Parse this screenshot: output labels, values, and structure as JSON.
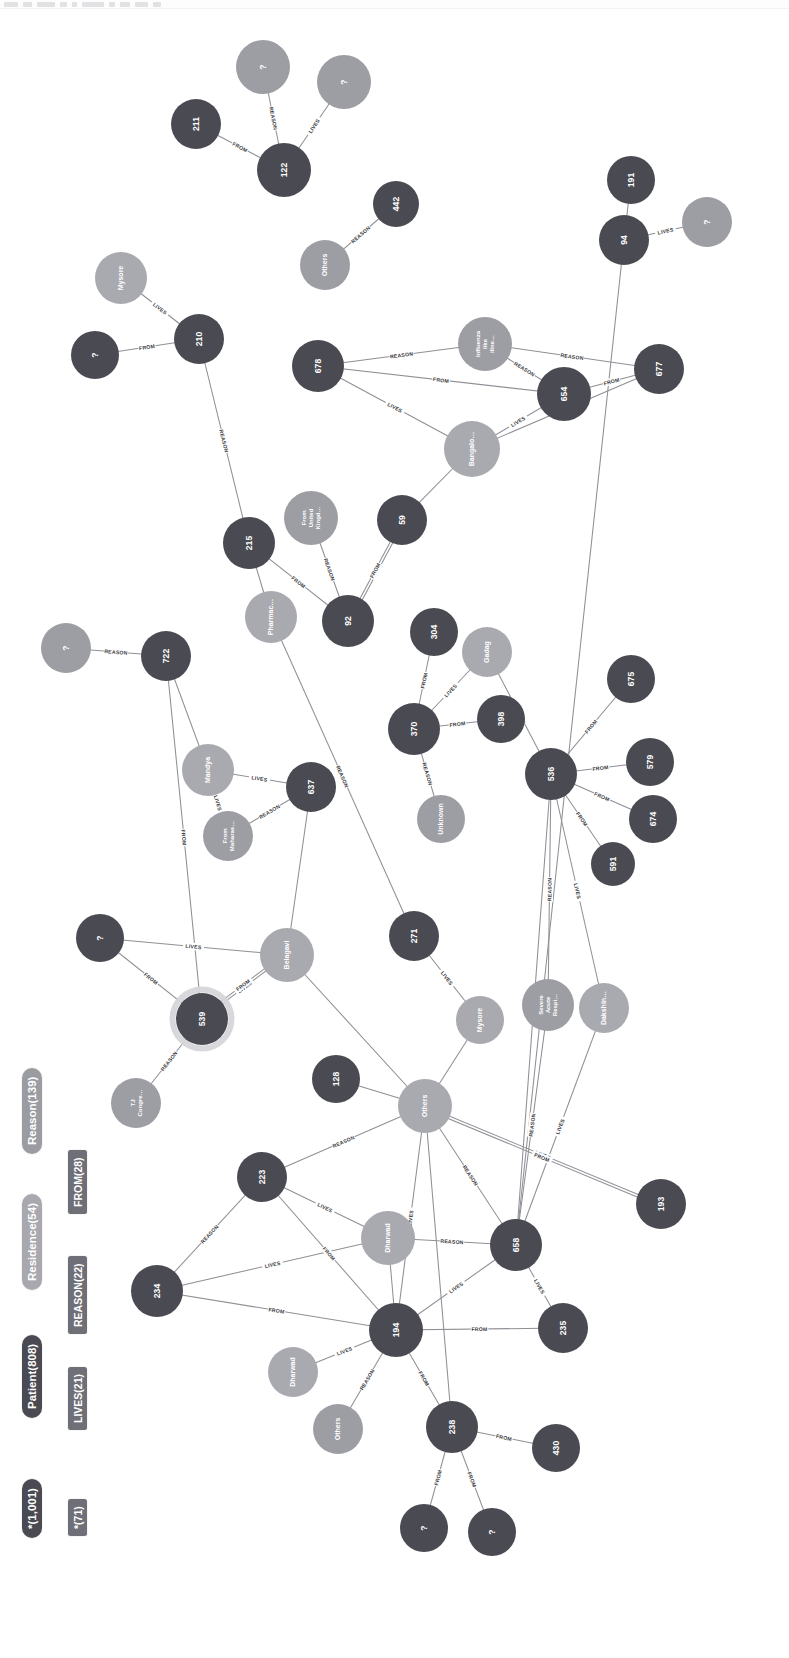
{
  "toolbar": {
    "chips": [
      14,
      9,
      18,
      7,
      5,
      22,
      6,
      10,
      13,
      8
    ]
  },
  "legend": {
    "node_categories": [
      {
        "label": "*(1,001)",
        "color": "#4a4a52",
        "text": "#ffffff"
      },
      {
        "label": "Patient(808)",
        "color": "#4a4a52",
        "text": "#ffffff"
      },
      {
        "label": "Residence(54)",
        "color": "#a8a8ae",
        "text": "#ffffff"
      },
      {
        "label": "Reason(139)",
        "color": "#9b9ba2",
        "text": "#ffffff"
      }
    ],
    "relationship_categories": [
      {
        "label": "*(71)",
        "color": "#6f6f77",
        "text": "#ffffff"
      },
      {
        "label": "LIVES(21)",
        "color": "#6f6f77",
        "text": "#ffffff"
      },
      {
        "label": "REASON(22)",
        "color": "#6f6f77",
        "text": "#ffffff"
      },
      {
        "label": "FROM(28)",
        "color": "#6f6f77",
        "text": "#ffffff"
      }
    ]
  },
  "colors": {
    "patient": "#4a4a52",
    "residence": "#a9a9b0",
    "reason": "#9d9da4",
    "edge": "#8f8f96",
    "background": "#ffffff",
    "selection_halo": "#d6d6da"
  },
  "chart_data": {
    "type": "graph",
    "node_count": 1001,
    "relationship_count": 71,
    "nodes": [
      {
        "id": "n_q1",
        "label": "?",
        "type": "reason",
        "x": 263,
        "y": 67,
        "r": 27
      },
      {
        "id": "n_q2",
        "label": "?",
        "type": "reason",
        "x": 344,
        "y": 82,
        "r": 27
      },
      {
        "id": "n_211",
        "label": "211",
        "type": "patient",
        "x": 196,
        "y": 124,
        "r": 25
      },
      {
        "id": "n_122",
        "label": "122",
        "type": "patient",
        "x": 284,
        "y": 170,
        "r": 27
      },
      {
        "id": "n_442",
        "label": "442",
        "type": "patient",
        "x": 396,
        "y": 204,
        "r": 23
      },
      {
        "id": "n_others1",
        "label": "Others",
        "type": "reason",
        "x": 325,
        "y": 265,
        "r": 25
      },
      {
        "id": "n_191",
        "label": "191",
        "type": "patient",
        "x": 631,
        "y": 180,
        "r": 24
      },
      {
        "id": "n_94",
        "label": "94",
        "type": "patient",
        "x": 624,
        "y": 240,
        "r": 25
      },
      {
        "id": "n_q3",
        "label": "?",
        "type": "reason",
        "x": 707,
        "y": 222,
        "r": 25
      },
      {
        "id": "n_mysore1",
        "label": "Mysore",
        "type": "residence",
        "x": 121,
        "y": 278,
        "r": 26
      },
      {
        "id": "n_q4",
        "label": "?",
        "type": "patient",
        "x": 95,
        "y": 355,
        "r": 24
      },
      {
        "id": "n_210",
        "label": "210",
        "type": "patient",
        "x": 199,
        "y": 339,
        "r": 25
      },
      {
        "id": "n_678",
        "label": "678",
        "type": "patient",
        "x": 318,
        "y": 366,
        "r": 26
      },
      {
        "id": "n_influ",
        "label": "Influenza like illne…",
        "type": "reason",
        "x": 485,
        "y": 344,
        "r": 27
      },
      {
        "id": "n_654",
        "label": "654",
        "type": "patient",
        "x": 564,
        "y": 394,
        "r": 27
      },
      {
        "id": "n_677",
        "label": "677",
        "type": "patient",
        "x": 659,
        "y": 369,
        "r": 25
      },
      {
        "id": "n_bang",
        "label": "Bangalo…",
        "type": "residence",
        "x": 472,
        "y": 449,
        "r": 28
      },
      {
        "id": "n_uk",
        "label": "From United Kingd…",
        "type": "reason",
        "x": 311,
        "y": 518,
        "r": 27
      },
      {
        "id": "n_59",
        "label": "59",
        "type": "patient",
        "x": 402,
        "y": 520,
        "r": 25
      },
      {
        "id": "n_215",
        "label": "215",
        "type": "patient",
        "x": 249,
        "y": 543,
        "r": 26
      },
      {
        "id": "n_pharma",
        "label": "Pharmac…",
        "type": "residence",
        "x": 271,
        "y": 617,
        "r": 26
      },
      {
        "id": "n_92",
        "label": "92",
        "type": "patient",
        "x": 348,
        "y": 621,
        "r": 26
      },
      {
        "id": "n_304",
        "label": "304",
        "type": "patient",
        "x": 434,
        "y": 632,
        "r": 24
      },
      {
        "id": "n_gadag",
        "label": "Gadag",
        "type": "residence",
        "x": 487,
        "y": 652,
        "r": 25
      },
      {
        "id": "n_q5",
        "label": "?",
        "type": "reason",
        "x": 66,
        "y": 648,
        "r": 25
      },
      {
        "id": "n_722",
        "label": "722",
        "type": "patient",
        "x": 166,
        "y": 656,
        "r": 25
      },
      {
        "id": "n_370",
        "label": "370",
        "type": "patient",
        "x": 414,
        "y": 729,
        "r": 26
      },
      {
        "id": "n_398",
        "label": "398",
        "type": "patient",
        "x": 501,
        "y": 719,
        "r": 24
      },
      {
        "id": "n_675",
        "label": "675",
        "type": "patient",
        "x": 631,
        "y": 679,
        "r": 24
      },
      {
        "id": "n_536",
        "label": "536",
        "type": "patient",
        "x": 551,
        "y": 774,
        "r": 26
      },
      {
        "id": "n_579",
        "label": "579",
        "type": "patient",
        "x": 650,
        "y": 762,
        "r": 24
      },
      {
        "id": "n_674",
        "label": "674",
        "type": "patient",
        "x": 653,
        "y": 819,
        "r": 24
      },
      {
        "id": "n_591",
        "label": "591",
        "type": "patient",
        "x": 613,
        "y": 864,
        "r": 22
      },
      {
        "id": "n_mandya",
        "label": "Mandya",
        "type": "residence",
        "x": 208,
        "y": 770,
        "r": 26
      },
      {
        "id": "n_637",
        "label": "637",
        "type": "patient",
        "x": 311,
        "y": 787,
        "r": 25
      },
      {
        "id": "n_mahar",
        "label": "From Maharas…",
        "type": "reason",
        "x": 228,
        "y": 836,
        "r": 25
      },
      {
        "id": "n_unk",
        "label": "Unknown",
        "type": "reason",
        "x": 441,
        "y": 819,
        "r": 24
      },
      {
        "id": "n_q6",
        "label": "?",
        "type": "patient",
        "x": 100,
        "y": 938,
        "r": 24
      },
      {
        "id": "n_belagavi",
        "label": "Belagavi",
        "type": "residence",
        "x": 287,
        "y": 955,
        "r": 27
      },
      {
        "id": "n_271",
        "label": "271",
        "type": "patient",
        "x": 414,
        "y": 936,
        "r": 25
      },
      {
        "id": "n_539",
        "label": "539",
        "type": "patient",
        "x": 202,
        "y": 1019,
        "r": 26,
        "selected": true
      },
      {
        "id": "n_mysore2",
        "label": "Mysore",
        "type": "residence",
        "x": 480,
        "y": 1020,
        "r": 24
      },
      {
        "id": "n_sars",
        "label": "Severe Acute Respi…",
        "type": "reason",
        "x": 548,
        "y": 1005,
        "r": 26
      },
      {
        "id": "n_dakshin",
        "label": "Dakshin…",
        "type": "residence",
        "x": 604,
        "y": 1008,
        "r": 25
      },
      {
        "id": "n_tjcong",
        "label": "TJ Congre…",
        "type": "reason",
        "x": 136,
        "y": 1103,
        "r": 25
      },
      {
        "id": "n_128",
        "label": "128",
        "type": "patient",
        "x": 336,
        "y": 1079,
        "r": 24
      },
      {
        "id": "n_others2",
        "label": "Others",
        "type": "residence",
        "x": 425,
        "y": 1106,
        "r": 27
      },
      {
        "id": "n_223",
        "label": "223",
        "type": "patient",
        "x": 262,
        "y": 1177,
        "r": 25
      },
      {
        "id": "n_dharwad1",
        "label": "Dharwad",
        "type": "residence",
        "x": 388,
        "y": 1238,
        "r": 27
      },
      {
        "id": "n_658",
        "label": "658",
        "type": "patient",
        "x": 516,
        "y": 1245,
        "r": 26
      },
      {
        "id": "n_193",
        "label": "193",
        "type": "patient",
        "x": 661,
        "y": 1204,
        "r": 25
      },
      {
        "id": "n_234",
        "label": "234",
        "type": "patient",
        "x": 157,
        "y": 1291,
        "r": 26
      },
      {
        "id": "n_194",
        "label": "194",
        "type": "patient",
        "x": 396,
        "y": 1330,
        "r": 27
      },
      {
        "id": "n_235",
        "label": "235",
        "type": "patient",
        "x": 563,
        "y": 1328,
        "r": 25
      },
      {
        "id": "n_dharwad2",
        "label": "Dharwad",
        "type": "residence",
        "x": 293,
        "y": 1372,
        "r": 25
      },
      {
        "id": "n_others3",
        "label": "Others",
        "type": "reason",
        "x": 338,
        "y": 1429,
        "r": 25
      },
      {
        "id": "n_238",
        "label": "238",
        "type": "patient",
        "x": 452,
        "y": 1427,
        "r": 26
      },
      {
        "id": "n_430",
        "label": "430",
        "type": "patient",
        "x": 556,
        "y": 1448,
        "r": 24
      },
      {
        "id": "n_q7",
        "label": "?",
        "type": "patient",
        "x": 424,
        "y": 1528,
        "r": 24
      },
      {
        "id": "n_q8",
        "label": "?",
        "type": "patient",
        "x": 492,
        "y": 1532,
        "r": 24
      }
    ],
    "edges": [
      {
        "source": "n_211",
        "target": "n_122",
        "label": "FROM"
      },
      {
        "source": "n_q1",
        "target": "n_122",
        "label": "REASON"
      },
      {
        "source": "n_q2",
        "target": "n_122",
        "label": "LIVES"
      },
      {
        "source": "n_others1",
        "target": "n_442",
        "label": "REASON"
      },
      {
        "source": "n_191",
        "target": "n_94",
        "label": ""
      },
      {
        "source": "n_94",
        "target": "n_q3",
        "label": "LIVES"
      },
      {
        "source": "n_94",
        "target": "n_658",
        "label": ""
      },
      {
        "source": "n_mysore1",
        "target": "n_210",
        "label": "LIVES"
      },
      {
        "source": "n_q4",
        "target": "n_210",
        "label": "FROM"
      },
      {
        "source": "n_210",
        "target": "n_215",
        "label": "REASON"
      },
      {
        "source": "n_678",
        "target": "n_influ",
        "label": "REASON"
      },
      {
        "source": "n_678",
        "target": "n_654",
        "label": "FROM"
      },
      {
        "source": "n_678",
        "target": "n_bang",
        "label": "LIVES"
      },
      {
        "source": "n_654",
        "target": "n_influ",
        "label": "REASON"
      },
      {
        "source": "n_677",
        "target": "n_influ",
        "label": "REASON"
      },
      {
        "source": "n_654",
        "target": "n_677",
        "label": "FROM"
      },
      {
        "source": "n_654",
        "target": "n_bang",
        "label": "LIVES"
      },
      {
        "source": "n_677",
        "target": "n_bang",
        "label": ""
      },
      {
        "source": "n_bang",
        "target": "n_59",
        "label": ""
      },
      {
        "source": "n_215",
        "target": "n_92",
        "label": "FROM"
      },
      {
        "source": "n_uk",
        "target": "n_92",
        "label": "REASON"
      },
      {
        "source": "n_92",
        "target": "n_59",
        "label": "FROM"
      },
      {
        "source": "n_92",
        "target": "n_59",
        "label": ""
      },
      {
        "source": "n_215",
        "target": "n_pharma",
        "label": ""
      },
      {
        "source": "n_pharma",
        "target": "n_271",
        "label": "REASON"
      },
      {
        "source": "n_q5",
        "target": "n_722",
        "label": "REASON"
      },
      {
        "source": "n_722",
        "target": "n_mandya",
        "label": ""
      },
      {
        "source": "n_722",
        "target": "n_539",
        "label": "FROM"
      },
      {
        "source": "n_mandya",
        "target": "n_637",
        "label": "LIVES"
      },
      {
        "source": "n_mandya",
        "target": "n_mahar",
        "label": "LIVES"
      },
      {
        "source": "n_637",
        "target": "n_mahar",
        "label": "REASON"
      },
      {
        "source": "n_637",
        "target": "n_belagavi",
        "label": ""
      },
      {
        "source": "n_304",
        "target": "n_370",
        "label": "FROM"
      },
      {
        "source": "n_gadag",
        "target": "n_370",
        "label": "LIVES"
      },
      {
        "source": "n_398",
        "target": "n_370",
        "label": "FROM"
      },
      {
        "source": "n_370",
        "target": "n_unk",
        "label": "REASON"
      },
      {
        "source": "n_536",
        "target": "n_675",
        "label": "FROM"
      },
      {
        "source": "n_536",
        "target": "n_579",
        "label": "FROM"
      },
      {
        "source": "n_536",
        "target": "n_674",
        "label": "FROM"
      },
      {
        "source": "n_536",
        "target": "n_591",
        "label": "FROM"
      },
      {
        "source": "n_536",
        "target": "n_gadag",
        "label": "REASON"
      },
      {
        "source": "n_536",
        "target": "n_sars",
        "label": "REASON"
      },
      {
        "source": "n_536",
        "target": "n_dakshin",
        "label": "LIVES"
      },
      {
        "source": "n_536",
        "target": "n_658",
        "label": ""
      },
      {
        "source": "n_q6",
        "target": "n_belagavi",
        "label": "LIVES"
      },
      {
        "source": "n_q6",
        "target": "n_539",
        "label": "FROM"
      },
      {
        "source": "n_belagavi",
        "target": "n_539",
        "label": "LIVES"
      },
      {
        "source": "n_belagavi",
        "target": "n_539",
        "label": "FROM"
      },
      {
        "source": "n_belagavi",
        "target": "n_others2",
        "label": ""
      },
      {
        "source": "n_539",
        "target": "n_tjcong",
        "label": "REASON"
      },
      {
        "source": "n_271",
        "target": "n_mysore2",
        "label": "LIVES"
      },
      {
        "source": "n_others2",
        "target": "n_mysore2",
        "label": ""
      },
      {
        "source": "n_others2",
        "target": "n_128",
        "label": ""
      },
      {
        "source": "n_others2",
        "target": "n_223",
        "label": "REASON"
      },
      {
        "source": "n_others2",
        "target": "n_193",
        "label": "LIVES"
      },
      {
        "source": "n_others2",
        "target": "n_193",
        "label": "FROM"
      },
      {
        "source": "n_others2",
        "target": "n_658",
        "label": "REASON"
      },
      {
        "source": "n_others2",
        "target": "n_194",
        "label": "LIVES"
      },
      {
        "source": "n_others2",
        "target": "n_238",
        "label": ""
      },
      {
        "source": "n_sars",
        "target": "n_658",
        "label": "REASON"
      },
      {
        "source": "n_dakshin",
        "target": "n_658",
        "label": "LIVES"
      },
      {
        "source": "n_223",
        "target": "n_dharwad1",
        "label": "LIVES"
      },
      {
        "source": "n_223",
        "target": "n_194",
        "label": "FROM"
      },
      {
        "source": "n_223",
        "target": "n_234",
        "label": "REASON"
      },
      {
        "source": "n_234",
        "target": "n_dharwad1",
        "label": "LIVES"
      },
      {
        "source": "n_234",
        "target": "n_194",
        "label": "FROM"
      },
      {
        "source": "n_dharwad1",
        "target": "n_194",
        "label": ""
      },
      {
        "source": "n_dharwad1",
        "target": "n_658",
        "label": "REASON"
      },
      {
        "source": "n_194",
        "target": "n_658",
        "label": "LIVES"
      },
      {
        "source": "n_658",
        "target": "n_235",
        "label": "LIVES"
      },
      {
        "source": "n_194",
        "target": "n_235",
        "label": "FROM"
      },
      {
        "source": "n_194",
        "target": "n_dharwad2",
        "label": "LIVES"
      },
      {
        "source": "n_194",
        "target": "n_others3",
        "label": "REASON"
      },
      {
        "source": "n_194",
        "target": "n_238",
        "label": "FROM"
      },
      {
        "source": "n_238",
        "target": "n_430",
        "label": "FROM"
      },
      {
        "source": "n_238",
        "target": "n_q7",
        "label": "FROM"
      },
      {
        "source": "n_238",
        "target": "n_q8",
        "label": "FROM"
      }
    ]
  }
}
